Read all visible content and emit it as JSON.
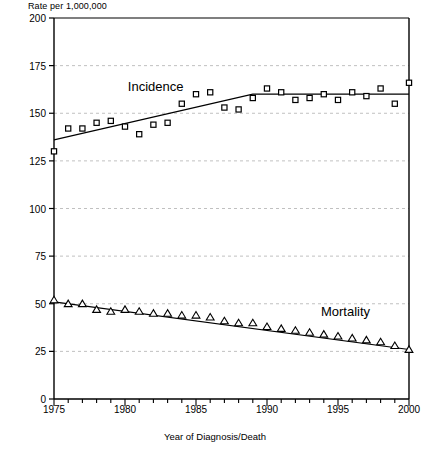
{
  "chart_data": {
    "type": "scatter",
    "title": "",
    "ylabel": "Rate per 1,000,000",
    "xlabel": "Year of Diagnosis/Death",
    "xlim": [
      1975,
      2000
    ],
    "ylim": [
      0,
      200
    ],
    "ytick_labels": [
      "0",
      "25",
      "50",
      "75",
      "100",
      "125",
      "150",
      "175",
      "200"
    ],
    "yticks": [
      0,
      25,
      50,
      75,
      100,
      125,
      150,
      175,
      200
    ],
    "xtick_labels": [
      "1975",
      "1980",
      "1985",
      "1990",
      "1995",
      "2000"
    ],
    "xticks": [
      1975,
      1980,
      1985,
      1990,
      1995,
      2000
    ],
    "minor_xtick_interval": 1,
    "grid": "horizontal-dashed",
    "legend": "inline-annotations",
    "x": [
      1975,
      1976,
      1977,
      1978,
      1979,
      1980,
      1981,
      1982,
      1983,
      1984,
      1985,
      1986,
      1987,
      1988,
      1989,
      1990,
      1991,
      1992,
      1993,
      1994,
      1995,
      1996,
      1997,
      1998,
      1999,
      2000
    ],
    "series": [
      {
        "name": "Incidence",
        "marker": "square",
        "values": [
          130,
          142,
          142,
          145,
          146,
          143,
          139,
          144,
          145,
          155,
          160,
          161,
          153,
          152,
          158,
          163,
          161,
          157,
          158,
          160,
          157,
          161,
          159,
          163,
          155,
          166
        ],
        "trend": [
          {
            "x": 1975,
            "y": 136
          },
          {
            "x": 1989,
            "y": 160
          },
          {
            "x": 2000,
            "y": 160
          }
        ]
      },
      {
        "name": "Mortality",
        "marker": "triangle",
        "values": [
          52,
          50,
          50,
          47,
          46,
          47,
          46,
          45,
          45,
          44,
          44,
          43,
          41,
          40,
          40,
          38,
          37,
          36,
          35,
          34,
          33,
          32,
          31,
          30,
          28,
          26
        ],
        "trend": [
          {
            "x": 1975,
            "y": 51
          },
          {
            "x": 2000,
            "y": 26
          }
        ]
      }
    ],
    "annotations": [
      {
        "text": "Incidence",
        "x": 1980.2,
        "y": 163
      },
      {
        "text": "Mortality",
        "x": 1993.8,
        "y": 45
      }
    ]
  }
}
